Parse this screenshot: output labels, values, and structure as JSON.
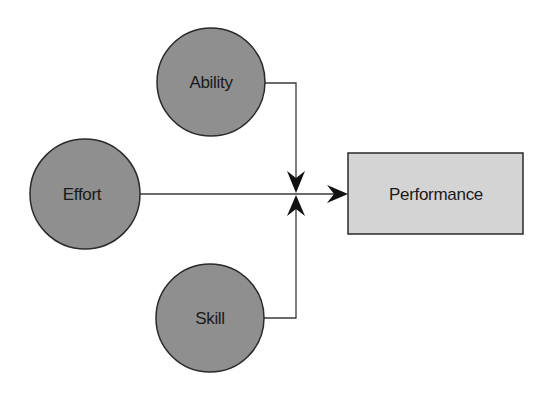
{
  "diagram": {
    "nodes": {
      "ability": {
        "label": "Ability",
        "shape": "circle",
        "color": "#8f8f8f"
      },
      "effort": {
        "label": "Effort",
        "shape": "circle",
        "color": "#8f8f8f"
      },
      "skill": {
        "label": "Skill",
        "shape": "circle",
        "color": "#8f8f8f"
      },
      "performance": {
        "label": "Performance",
        "shape": "rectangle",
        "color": "#d4d4d4"
      }
    },
    "edges": [
      {
        "from": "ability",
        "to": "junction",
        "arrow": "down"
      },
      {
        "from": "skill",
        "to": "junction",
        "arrow": "up"
      },
      {
        "from": "effort",
        "to": "performance",
        "arrow": "right"
      }
    ],
    "colors": {
      "stroke": "#2a2a2a",
      "line": "#3a3a3a"
    }
  }
}
